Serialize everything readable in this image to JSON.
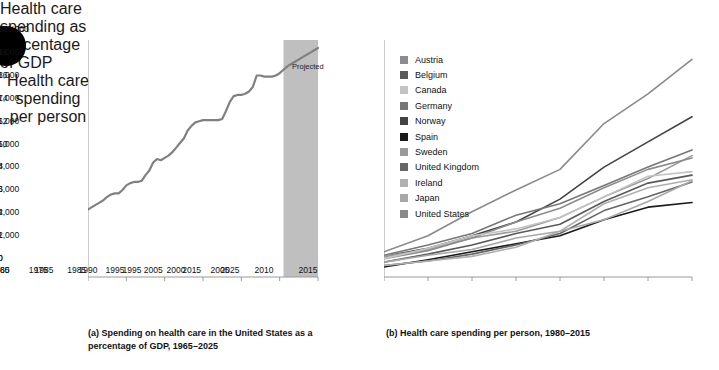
{
  "bullet": {
    "name": "bullet-circle",
    "color": "#000000"
  },
  "panel_a": {
    "title": "Health care\nspending as\npercentage\nof GDP",
    "title_lines": [
      "Health care",
      "spending as",
      "percentage",
      "of GDP"
    ],
    "caption": "(a) Spending on health care in the United States as a percentage of GDP, 1965–2025",
    "projected_label": "Projected",
    "line_color": "#808080",
    "band_color": "#bfbfbf"
  },
  "panel_b": {
    "title_lines": [
      "Health care",
      "spending",
      "per person"
    ],
    "caption": "(b) Health care spending per person, 1980–2015"
  },
  "legend": {
    "items": [
      {
        "label": "Austria",
        "color": "#8c8c8c"
      },
      {
        "label": "Belgium",
        "color": "#595959"
      },
      {
        "label": "Canada",
        "color": "#c4c4c4"
      },
      {
        "label": "Germany",
        "color": "#777777"
      },
      {
        "label": "Norway",
        "color": "#434343"
      },
      {
        "label": "Spain",
        "color": "#1a1a1a"
      },
      {
        "label": "Sweden",
        "color": "#9a9a9a"
      },
      {
        "label": "United Kingdom",
        "color": "#666666"
      },
      {
        "label": "Ireland",
        "color": "#b0b0b0"
      },
      {
        "label": "Japan",
        "color": "#a8a8a8"
      },
      {
        "label": "United States",
        "color": "#8a8a8a"
      }
    ]
  },
  "chart_data": [
    {
      "type": "line",
      "id": "panel-a",
      "title": "Health care spending as percentage of GDP",
      "xlabel": "",
      "ylabel": "Health care spending as percentage of GDP",
      "xlim": [
        1965,
        2025
      ],
      "ylim": [
        0,
        20
      ],
      "xticks": [
        1965,
        1975,
        1985,
        1995,
        2005,
        2015,
        2025
      ],
      "yticks": [
        0,
        2,
        4,
        6,
        8,
        10,
        12,
        14,
        16,
        18,
        20
      ],
      "ytick_labels": [
        "0",
        "2",
        "4",
        "6",
        "8",
        "10",
        "12",
        "14",
        "16",
        "18",
        "20%"
      ],
      "grid": false,
      "legend": "none",
      "shaded_region": {
        "label": "Projected",
        "x_start": 2016,
        "x_end": 2025,
        "color": "#bfbfbf"
      },
      "series": [
        {
          "name": "United States health spending share of GDP",
          "color": "#808080",
          "x": [
            1965,
            1966,
            1967,
            1968,
            1969,
            1970,
            1971,
            1972,
            1973,
            1974,
            1975,
            1976,
            1977,
            1978,
            1979,
            1980,
            1981,
            1982,
            1983,
            1984,
            1985,
            1986,
            1987,
            1988,
            1989,
            1990,
            1991,
            1992,
            1993,
            1994,
            1995,
            1996,
            1997,
            1998,
            1999,
            2000,
            2001,
            2002,
            2003,
            2004,
            2005,
            2006,
            2007,
            2008,
            2009,
            2010,
            2011,
            2012,
            2013,
            2014,
            2015,
            2016,
            2017,
            2018,
            2019,
            2020,
            2021,
            2022,
            2023,
            2024,
            2025
          ],
          "y": [
            5.9,
            6.1,
            6.3,
            6.5,
            6.7,
            7.0,
            7.2,
            7.3,
            7.3,
            7.6,
            8.0,
            8.2,
            8.3,
            8.3,
            8.4,
            8.9,
            9.3,
            10.0,
            10.3,
            10.2,
            10.4,
            10.6,
            10.9,
            11.3,
            11.7,
            12.1,
            12.8,
            13.2,
            13.5,
            13.6,
            13.7,
            13.7,
            13.7,
            13.7,
            13.7,
            13.8,
            14.5,
            15.3,
            15.8,
            15.9,
            15.9,
            16.0,
            16.2,
            16.6,
            17.6,
            17.6,
            17.5,
            17.5,
            17.5,
            17.6,
            17.8,
            18.1,
            18.4,
            18.6,
            18.8,
            19.0,
            19.2,
            19.4,
            19.6,
            19.8,
            20.0
          ]
        }
      ]
    },
    {
      "type": "line",
      "id": "panel-b",
      "title": "Health care spending per person",
      "xlabel": "",
      "ylabel": "Health care spending per person",
      "xlim": [
        1980,
        2015
      ],
      "ylim": [
        0,
        10000
      ],
      "xticks": [
        1980,
        1985,
        1990,
        1995,
        2000,
        2005,
        2010,
        2015
      ],
      "yticks": [
        0,
        1000,
        2000,
        3000,
        4000,
        5000,
        6000,
        7000,
        8000,
        9000,
        10000
      ],
      "ytick_labels": [
        "0",
        "1,000",
        "2,000",
        "3,000",
        "4,000",
        "5,000",
        "6,000",
        "7,000",
        "8,000",
        "9,000",
        "$10,000"
      ],
      "grid": false,
      "legend": "upper-left",
      "x": [
        1980,
        1985,
        1990,
        1995,
        2000,
        2005,
        2010,
        2015
      ],
      "series": [
        {
          "name": "United States",
          "color": "#8a8a8a",
          "values": [
            1100,
            1800,
            2850,
            3800,
            4700,
            6700,
            8000,
            9500
          ]
        },
        {
          "name": "Spain",
          "color": "#1a1a1a",
          "values": [
            440,
            750,
            1100,
            1450,
            1800,
            2500,
            3050,
            3250
          ]
        },
        {
          "name": "Norway",
          "color": "#434343",
          "values": [
            900,
            1250,
            1800,
            2400,
            3400,
            4800,
            5900,
            7000
          ]
        },
        {
          "name": "Germany",
          "color": "#777777",
          "values": [
            950,
            1400,
            1900,
            2700,
            3200,
            4000,
            4800,
            5550
          ]
        },
        {
          "name": "Sweden",
          "color": "#9a9a9a",
          "values": [
            900,
            1200,
            1700,
            2000,
            2600,
            3500,
            4300,
            5300
          ]
        },
        {
          "name": "Austria",
          "color": "#8c8c8c",
          "values": [
            800,
            1150,
            1700,
            2400,
            3000,
            3900,
            4700,
            5200
          ]
        },
        {
          "name": "Canada",
          "color": "#c4c4c4",
          "values": [
            800,
            1250,
            1800,
            2100,
            2600,
            3500,
            4400,
            4600
          ]
        },
        {
          "name": "Belgium",
          "color": "#595959",
          "values": [
            650,
            1000,
            1400,
            1900,
            2300,
            3300,
            4100,
            4450
          ]
        },
        {
          "name": "United Kingdom",
          "color": "#666666",
          "values": [
            500,
            700,
            1000,
            1400,
            1900,
            2900,
            3500,
            4150
          ]
        },
        {
          "name": "Ireland",
          "color": "#b0b0b0",
          "values": [
            500,
            700,
            900,
            1300,
            2000,
            3200,
            3900,
            4250
          ]
        },
        {
          "name": "Japan",
          "color": "#a8a8a8",
          "values": [
            650,
            950,
            1200,
            1700,
            2000,
            2500,
            3300,
            4200
          ]
        }
      ]
    }
  ]
}
